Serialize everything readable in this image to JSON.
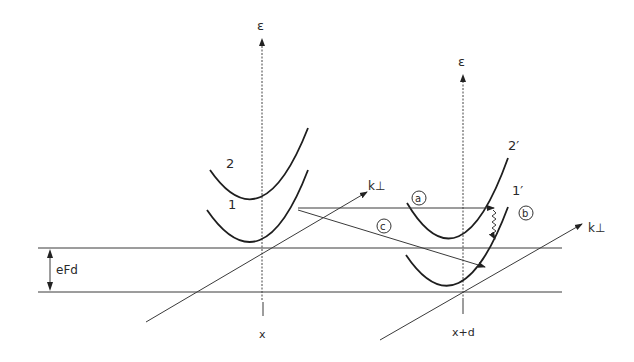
{
  "diagram": {
    "left_site": {
      "energy_axis_label": "ε",
      "position_label": "x",
      "band_labels": [
        "2",
        "1"
      ],
      "momentum_axis_label": "k⊥"
    },
    "right_site": {
      "energy_axis_label": "ε",
      "position_label": "x+d",
      "band_labels": [
        "2′",
        "1′"
      ],
      "momentum_axis_label": "k⊥"
    },
    "energy_offset_label": "eFd",
    "transition_labels": [
      "a",
      "b",
      "c"
    ],
    "colors": {
      "line": "#1e1e1e",
      "background": "#ffffff"
    }
  }
}
